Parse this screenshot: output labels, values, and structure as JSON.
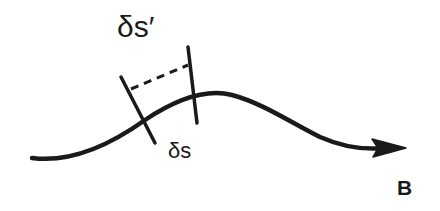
{
  "diagram": {
    "labels": {
      "ds_prime": "δs′",
      "ds": "δs",
      "field": "B"
    },
    "colors": {
      "stroke": "#1a1a1a",
      "background": "#ffffff"
    },
    "elements": {
      "curve": "field line with arrowhead pointing right",
      "segment_left": "tick line crossing curve (start of δs)",
      "segment_right": "tick line crossing curve (end of δs)",
      "dashed_link": "dashed line connecting upper ends of tick lines (δs′)"
    }
  }
}
